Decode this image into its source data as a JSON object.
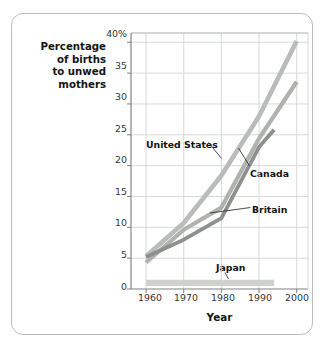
{
  "figure": {
    "ylabel_lines": [
      "Percentage",
      "of births",
      "to unwed",
      "mothers"
    ],
    "xlabel": "Year"
  },
  "chart_data": {
    "type": "line",
    "title": "",
    "xlabel": "Year",
    "ylabel": "Percentage of births to unwed mothers",
    "xlim": [
      1956,
      2003
    ],
    "ylim": [
      0,
      41.5
    ],
    "xticks": [
      1960,
      1970,
      1980,
      1990,
      2000
    ],
    "xtick_labels": [
      "1960",
      "1970",
      "1980",
      "1990",
      "2000"
    ],
    "yticks": [
      0,
      5,
      10,
      15,
      20,
      25,
      30,
      35,
      40
    ],
    "ytick_labels": [
      "0",
      "5",
      "10",
      "15",
      "20",
      "25",
      "30",
      "35",
      "40%"
    ],
    "grid": true,
    "legend": "inline-annotations",
    "series": [
      {
        "name": "United States",
        "color": "#b9bcba",
        "x": [
          1960,
          1970,
          1980,
          1990,
          2000
        ],
        "values": [
          5.3,
          10.7,
          18.4,
          28.0,
          40.2
        ]
      },
      {
        "name": "Canada",
        "color": "#b0b2ad",
        "x": [
          1960,
          1970,
          1980,
          1990,
          2000
        ],
        "values": [
          4.3,
          9.6,
          13.2,
          24.4,
          33.6
        ]
      },
      {
        "name": "Britain",
        "color": "#8d908d",
        "x": [
          1960,
          1970,
          1980,
          1990,
          1994
        ],
        "values": [
          5.2,
          8.0,
          11.5,
          23.0,
          25.8
        ]
      },
      {
        "name": "Japan",
        "color": "#cfd1cd",
        "x": [
          1960,
          1994
        ],
        "values": [
          1.0,
          1.0
        ]
      }
    ],
    "annotations": [
      {
        "label": "United States",
        "points_to_series": "United States"
      },
      {
        "label": "Canada",
        "points_to_series": "Canada"
      },
      {
        "label": "Britain",
        "points_to_series": "Britain"
      },
      {
        "label": "Japan",
        "points_to_series": "Japan"
      }
    ]
  }
}
